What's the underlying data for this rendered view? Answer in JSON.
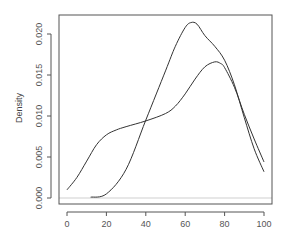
{
  "chart_data": {
    "type": "line",
    "title": "",
    "xlabel": "",
    "ylabel": "Density",
    "xlim": [
      0,
      100
    ],
    "ylim": [
      0,
      0.022
    ],
    "grid": false,
    "legend": null,
    "x_ticks": [
      "0",
      "20",
      "40",
      "60",
      "80",
      "100"
    ],
    "y_ticks": [
      "0.000",
      "0.005",
      "0.010",
      "0.015",
      "0.020"
    ],
    "series": [
      {
        "name": "density-1",
        "color": "#333333",
        "x": [
          12,
          20,
          30,
          40,
          50,
          55,
          60,
          63,
          66,
          70,
          75,
          80,
          85,
          90,
          95,
          100
        ],
        "y": [
          0.0001,
          0.0005,
          0.0035,
          0.0095,
          0.0155,
          0.0185,
          0.0208,
          0.0214,
          0.0212,
          0.0198,
          0.0185,
          0.0168,
          0.0138,
          0.0098,
          0.006,
          0.0032
        ]
      },
      {
        "name": "density-2",
        "color": "#333333",
        "x": [
          0,
          5,
          10,
          15,
          20,
          25,
          30,
          40,
          50,
          55,
          60,
          65,
          70,
          75,
          78,
          80,
          85,
          90,
          95,
          100
        ],
        "y": [
          0.001,
          0.0025,
          0.0045,
          0.0065,
          0.0077,
          0.0083,
          0.0087,
          0.0094,
          0.0103,
          0.0112,
          0.0127,
          0.0145,
          0.016,
          0.0166,
          0.0164,
          0.0159,
          0.0135,
          0.0102,
          0.0072,
          0.0044
        ]
      }
    ],
    "baseline": 0
  }
}
